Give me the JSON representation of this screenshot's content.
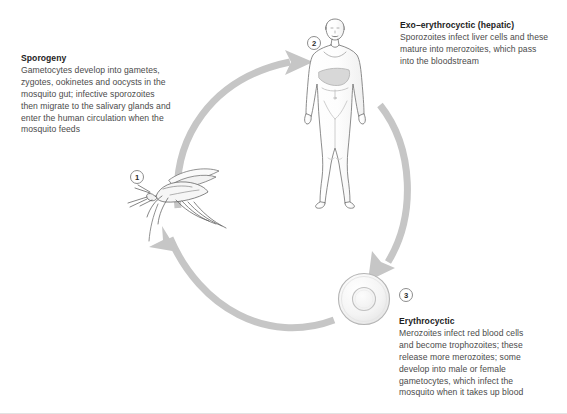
{
  "figure": {
    "background": "#ffffff",
    "arrow_color": "#c6c6c6",
    "heading_color": "#1d1d1d",
    "body_color": "#4b4b4b",
    "outline_color": "#6e6e6e"
  },
  "steps": [
    {
      "number": "1",
      "anchor": "mosquito"
    },
    {
      "number": "2",
      "anchor": "human"
    },
    {
      "number": "3",
      "anchor": "red-blood-cell"
    }
  ],
  "captions": {
    "sporogeny": {
      "heading": "Sporogeny",
      "body": "Gametocytes develop into gametes,\nzygotes, ookinetes and oocysts in the\nmosquito gut; infective sporozoites\nthen migrate to the salivary glands and\nenter the human circulation when the\nmosquito feeds"
    },
    "exo_erythrocytic": {
      "heading": "Exo–erythrocyctic (hepatic)",
      "body": "Sporozoites infect liver cells and these\nmature into merozoites, which pass\ninto the bloodstream"
    },
    "erythrocytic": {
      "heading": "Erythrocyctic",
      "body": "Merozoites infect red blood cells\nand become trophozoites; these\nrelease more merozoites; some\ndevelop into male or female\ngametocytes, which infect the\nmosquito when it takes up blood"
    }
  },
  "illustrations": {
    "mosquito": "mosquito-illustration",
    "human": "human-body-illustration",
    "red_blood_cell": "red-blood-cell-illustration"
  },
  "arrows": [
    {
      "name": "arrow-mosquito-to-human",
      "from": "mosquito",
      "to": "human"
    },
    {
      "name": "arrow-human-to-red-blood-cell",
      "from": "human",
      "to": "red-blood-cell"
    },
    {
      "name": "arrow-red-blood-cell-to-mosquito",
      "from": "red-blood-cell",
      "to": "mosquito"
    }
  ]
}
